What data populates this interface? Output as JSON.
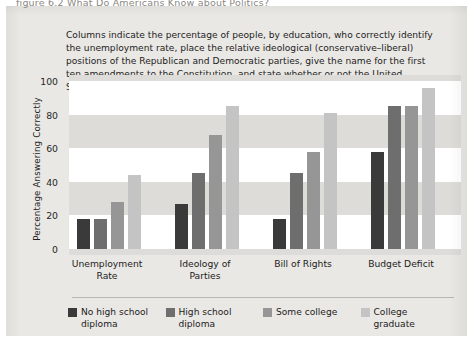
{
  "figure": {
    "clipped_header_line": "figure 6.2  What Do Americans Know about Politics?",
    "caption": "Columns indicate the percentage of people, by education, who correctly identify the unemployment rate, place the relative ideological (conservative–liberal) positions of the Republican and Democratic parties, give the name for the first ten amendments to the Constitution, and state whether or not the United States has a budget deficit."
  },
  "chart_data": {
    "type": "bar",
    "title": "",
    "xlabel": "",
    "ylabel": "Percentage Answering Correctly",
    "ylim": [
      0,
      100
    ],
    "yticks": [
      0,
      20,
      40,
      60,
      80,
      100
    ],
    "grid": "alternating-horizontal-bands",
    "legend_position": "bottom",
    "categories": [
      "Unemployment Rate",
      "Ideology of Parties",
      "Bill of Rights",
      "Budget Deficit"
    ],
    "series": [
      {
        "name": "No high school diploma",
        "color": "#3a3a3a",
        "values": [
          18,
          27,
          18,
          58
        ]
      },
      {
        "name": "High school diploma",
        "color": "#6e6e6e",
        "values": [
          18,
          45,
          45,
          85
        ]
      },
      {
        "name": "Some college",
        "color": "#969696",
        "values": [
          28,
          68,
          58,
          85
        ]
      },
      {
        "name": "College graduate",
        "color": "#c4c4c4",
        "values": [
          44,
          85,
          81,
          96
        ]
      }
    ]
  },
  "legend": [
    {
      "label": "No high school diploma",
      "color": "#3a3a3a"
    },
    {
      "label": "High school diploma",
      "color": "#6e6e6e"
    },
    {
      "label": "Some college",
      "color": "#969696"
    },
    {
      "label": "College graduate",
      "color": "#c4c4c4"
    }
  ]
}
